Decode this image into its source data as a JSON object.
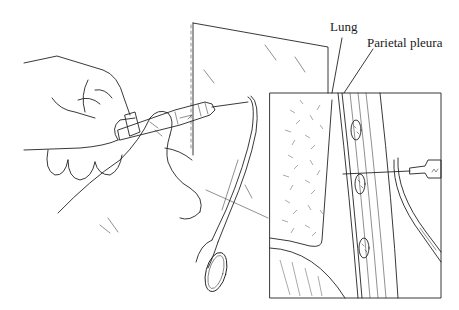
{
  "figure": {
    "labels": {
      "lung": "Lung",
      "parietal_pleura": "Parietal pleura"
    },
    "colors": {
      "line": "#222222",
      "background": "#ffffff"
    }
  }
}
